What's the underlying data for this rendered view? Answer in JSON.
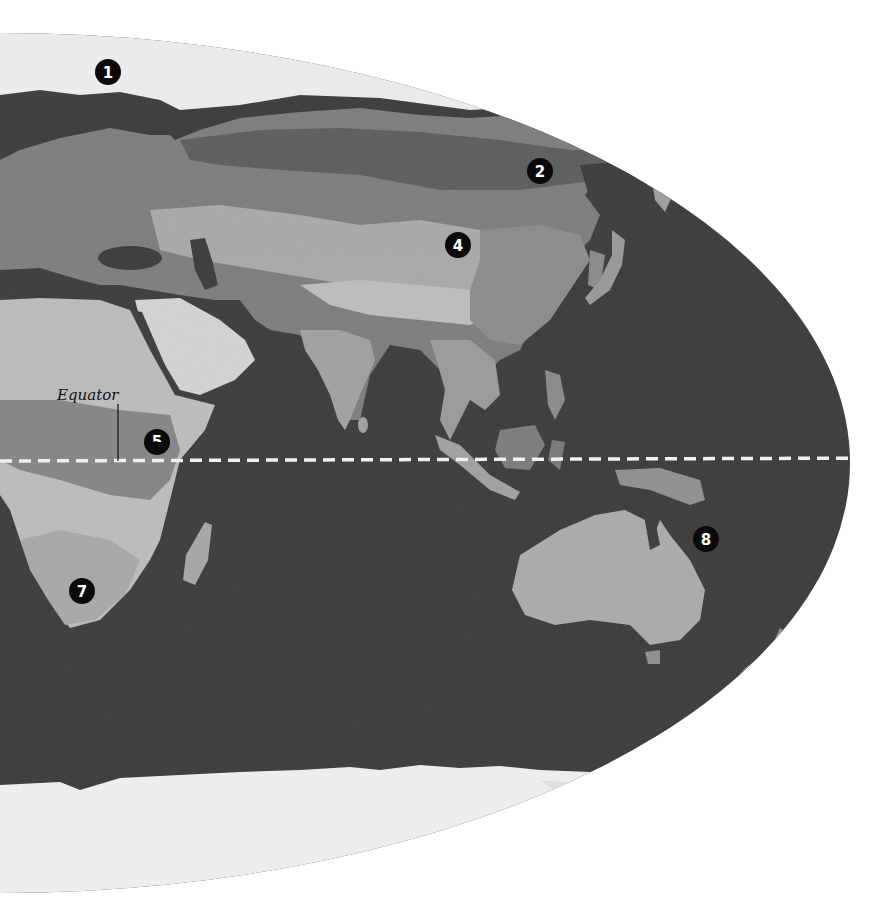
{
  "map": {
    "projection_view": "eastern-hemisphere",
    "colors": {
      "background": "#ffffff",
      "ocean": "#3b3b3b",
      "ice": "#f2f2f2",
      "land_light": "#b9b9b9",
      "land_mid": "#8f8f8f",
      "land_dark": "#5e5e5e",
      "desert": "#d4d4d4",
      "marker_fill": "#0a0a0a",
      "marker_text": "#ffffff",
      "equator_line": "#f0f0f0"
    },
    "equator": {
      "label": "Equator",
      "y": 459
    },
    "markers": [
      {
        "id": "1",
        "label": "1",
        "x": 108,
        "y": 72,
        "region": "arctic-europe"
      },
      {
        "id": "2",
        "label": "2",
        "x": 540,
        "y": 171,
        "region": "siberia"
      },
      {
        "id": "4",
        "label": "4",
        "x": 458,
        "y": 245,
        "region": "central-asia"
      },
      {
        "id": "5",
        "label": "5",
        "x": 157,
        "y": 442,
        "region": "east-africa"
      },
      {
        "id": "7",
        "label": "7",
        "x": 82,
        "y": 591,
        "region": "southern-africa"
      },
      {
        "id": "8",
        "label": "8",
        "x": 706,
        "y": 539,
        "region": "eastern-australia"
      }
    ]
  }
}
